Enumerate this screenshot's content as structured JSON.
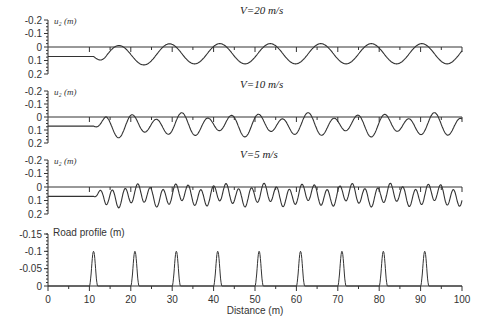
{
  "chart_data": [
    {
      "type": "line",
      "title": "V=20 m/s",
      "ylabel": "u2 (m)",
      "xlabel": "",
      "xlim": [
        0,
        100
      ],
      "ylim": [
        -0.2,
        0.2
      ],
      "yticks": [
        "-0.2",
        "-0.1",
        "0",
        "0.1",
        "0.2"
      ],
      "y_inverted": true,
      "description": "Zero line and displacement response; initial offset 0.07 m until x~11 m, then oscillation with wavelength ~12 m, amplitude ~0.06-0.1 m",
      "series": [
        {
          "name": "u2",
          "start_offset": 0.07,
          "onset_x": 11,
          "wavelength": 12.2,
          "amplitude": 0.075,
          "mean": 0.05
        }
      ]
    },
    {
      "type": "line",
      "title": "V=10 m/s",
      "ylabel": "u2 (m)",
      "xlim": [
        0,
        100
      ],
      "ylim": [
        -0.2,
        0.2
      ],
      "yticks": [
        "-0.2",
        "-0.1",
        "0",
        "0.1",
        "0.2"
      ],
      "y_inverted": true,
      "series": [
        {
          "name": "u2",
          "start_offset": 0.07,
          "onset_x": 11,
          "wavelength": 6.1,
          "amplitude": 0.085,
          "mean": 0.06
        }
      ]
    },
    {
      "type": "line",
      "title": "V=5 m/s",
      "ylabel": "u2 (m)",
      "xlim": [
        0,
        100
      ],
      "ylim": [
        -0.2,
        0.2
      ],
      "yticks": [
        "-0.2",
        "-0.1",
        "0",
        "0.1",
        "0.2"
      ],
      "y_inverted": true,
      "series": [
        {
          "name": "u2",
          "start_offset": 0.07,
          "onset_x": 11,
          "wavelength": 3.05,
          "amplitude": 0.08,
          "mean": 0.06
        }
      ]
    },
    {
      "type": "line",
      "title": "Road profile (m)",
      "ylabel": "Road profile (m)",
      "xlabel": "Distance (m)",
      "xlim": [
        0,
        100
      ],
      "ylim": [
        -0.15,
        0
      ],
      "yticks": [
        "-0.15",
        "-0.1",
        "-0.05",
        "0"
      ],
      "xticks": [
        "0",
        "10",
        "20",
        "30",
        "40",
        "50",
        "60",
        "70",
        "80",
        "90",
        "100"
      ],
      "series": [
        {
          "name": "road",
          "bump_centers": [
            11,
            21,
            31,
            41,
            51,
            61,
            71,
            81,
            91
          ],
          "bump_height": 0.1,
          "bump_width": 2
        }
      ]
    }
  ],
  "labels": {
    "panel1_title": "V=20 m/s",
    "panel2_title": "V=10 m/s",
    "panel3_title": "V=5 m/s",
    "ylabel_u2": "u₂ (m)",
    "road_label": "Road profile (m)",
    "xlabel": "Distance (m)"
  }
}
